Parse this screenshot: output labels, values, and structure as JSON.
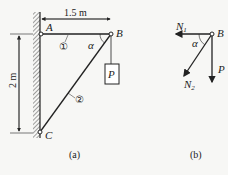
{
  "figure_a": {
    "caption": "(a)",
    "points": {
      "A": "A",
      "B": "B",
      "C": "C"
    },
    "dimension_horizontal": "1.5 m",
    "dimension_vertical": "2 m",
    "member_1": "①",
    "member_2": "②",
    "angle": "α",
    "load": "P"
  },
  "figure_b": {
    "caption": "(b)",
    "point": "B",
    "force_1": "N",
    "force_1_sub": "1",
    "force_2": "N",
    "force_2_sub": "2",
    "load": "P",
    "angle": "α"
  }
}
